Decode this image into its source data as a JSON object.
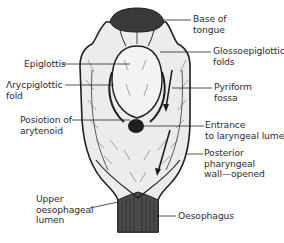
{
  "diagram": {
    "colors": {
      "ink": "#1f1f1f",
      "tongue_fill": "#3a3a3a",
      "tissue_fill": "#ececec",
      "background": "#ffffff",
      "leader_line": "#2a2a2a"
    },
    "labels": {
      "base_of_tongue": "Base of\ntongue",
      "glossoepiglottic_folds": "Glossoepiglottic\nfolds",
      "pyriform_fossa": "Pyriform\nfossa",
      "entrance_laryngeal_lumen": "Entrance\nto laryngeal lumen",
      "posterior_pharyngeal_wall": "Posterior\npharyngeal\nwall—opened",
      "oesophagus": "Oesophagus",
      "epiglottis": "Epiglottis",
      "aryepiglottic_fold": "Λrycpiglottic\nfold",
      "position_of_arytenoid": "Posiotion of\narytenoid",
      "upper_oesophageal_lumen": "Upper\noesophageal\nlumen"
    }
  }
}
